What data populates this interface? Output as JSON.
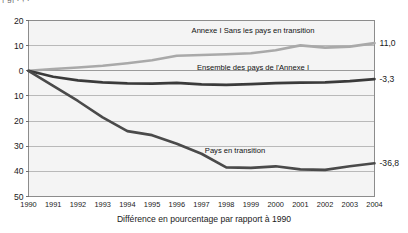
{
  "top_partial_text": "|  g|                     .                    ,                  .",
  "caption": "Différence en pourcentage par rapport à 1990",
  "axis": {
    "y_ticks": [
      "20",
      "10",
      "0",
      "10",
      "20",
      "30",
      "40",
      "50"
    ],
    "x_ticks": [
      "1990",
      "1991",
      "1992",
      "1993",
      "1994",
      "1995",
      "1996",
      "1997",
      "1998",
      "1999",
      "2000",
      "2001",
      "2002",
      "2003",
      "2004"
    ]
  },
  "end_labels": {
    "annexe_sans_transition": "11,0",
    "ensemble_annexe": "-3,3",
    "pays_transition": "-36,8"
  },
  "series_labels": {
    "annexe_sans_transition": "Annexe I Sans les pays en transition",
    "ensemble_annexe": "Ensemble des pays de l'Annexe I",
    "pays_transition": "Pays en transition"
  },
  "colors": {
    "grey_series": "#a9a9a9",
    "dark_series": "#3a3a3a",
    "transition_series": "#4a4a4a",
    "grid": "#b9b9b9",
    "frame": "#8c8c8c",
    "plot_bg": "#f4f4f4"
  },
  "chart_data": {
    "type": "line",
    "title": "",
    "xlabel": "Différence en pourcentage par rapport à 1990",
    "ylabel": "",
    "x": [
      1990,
      1991,
      1992,
      1993,
      1994,
      1995,
      1996,
      1997,
      1998,
      1999,
      2000,
      2001,
      2002,
      2003,
      2004
    ],
    "ylim": [
      -50,
      20
    ],
    "yticks": [
      20,
      10,
      0,
      -10,
      -20,
      -30,
      -40,
      -50
    ],
    "ytick_labels": [
      "20",
      "10",
      "0",
      "10",
      "20",
      "30",
      "40",
      "50"
    ],
    "grid": true,
    "legend": "inline-annotations",
    "series": [
      {
        "name": "Annexe I Sans les pays en transition",
        "color": "#a9a9a9",
        "end_label": "11,0",
        "values": [
          0.0,
          0.7,
          1.3,
          2.0,
          3.0,
          4.2,
          6.0,
          6.3,
          6.6,
          7.0,
          8.2,
          10.1,
          9.2,
          9.6,
          11.0
        ]
      },
      {
        "name": "Ensemble des pays de l'Annexe I",
        "color": "#3a3a3a",
        "end_label": "-3,3",
        "values": [
          0.0,
          -2.4,
          -3.8,
          -4.6,
          -5.0,
          -5.1,
          -4.8,
          -5.4,
          -5.6,
          -5.3,
          -4.9,
          -4.7,
          -4.6,
          -4.1,
          -3.3
        ]
      },
      {
        "name": "Pays en transition",
        "color": "#4a4a4a",
        "end_label": "-36,8",
        "values": [
          0.0,
          -6.0,
          -12.0,
          -18.5,
          -24.0,
          -25.6,
          -29.0,
          -33.0,
          -38.4,
          -38.6,
          -38.0,
          -39.2,
          -39.4,
          -38.0,
          -36.8
        ]
      }
    ]
  }
}
